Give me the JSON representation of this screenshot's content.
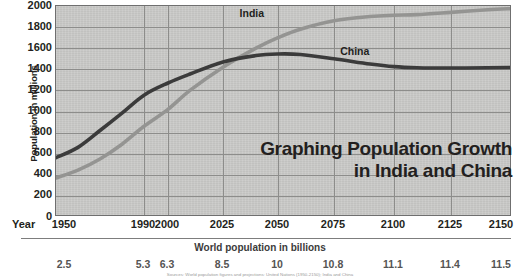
{
  "chart_data": {
    "type": "line",
    "title": "Graphing Population Growth in India and China",
    "title_line1": "Graphing Population Growth",
    "title_line2": "in India and China",
    "xlabel": "Year",
    "ylabel": "Population in millions",
    "secondary_xlabel": "World population in billions",
    "grid": true,
    "legend_position": "inline-labels",
    "xlim": [
      1950,
      2150
    ],
    "ylim": [
      0,
      2000
    ],
    "x_ticks": [
      1950,
      1990,
      2000,
      2025,
      2050,
      2075,
      2100,
      2125,
      2150
    ],
    "x_tick_labels": [
      "1950",
      "1990",
      "2000",
      "2025",
      "2050",
      "2075",
      "2100",
      "2125",
      "2150"
    ],
    "y_ticks": [
      0,
      200,
      400,
      600,
      800,
      1000,
      1200,
      1400,
      1600,
      1800,
      2000
    ],
    "y_tick_labels": [
      "0",
      "200",
      "400",
      "600",
      "800",
      "1000",
      "1200",
      "1400",
      "1600",
      "1800",
      "2000"
    ],
    "secondary_x_ticks": [
      1950,
      1990,
      2000,
      2025,
      2050,
      2075,
      2100,
      2125,
      2150
    ],
    "secondary_x_tick_labels": [
      "2.5",
      "5.3",
      "6.3",
      "8.5",
      "10",
      "10.8",
      "11.1",
      "11.4",
      "11.5"
    ],
    "series": [
      {
        "name": "China",
        "color": "#3b3b3b",
        "label_x": 2078,
        "label_y": 1560,
        "x": [
          1950,
          1960,
          1970,
          1980,
          1990,
          2000,
          2010,
          2025,
          2040,
          2050,
          2060,
          2075,
          2090,
          2100,
          2110,
          2125,
          2140,
          2150
        ],
        "values": [
          562,
          660,
          820,
          985,
          1155,
          1270,
          1355,
          1470,
          1530,
          1545,
          1540,
          1500,
          1450,
          1425,
          1415,
          1412,
          1415,
          1418
        ]
      },
      {
        "name": "India",
        "color": "#949492",
        "label_x": 2033,
        "label_y": 1925,
        "x": [
          1950,
          1960,
          1970,
          1980,
          1990,
          2000,
          2010,
          2025,
          2040,
          2050,
          2060,
          2075,
          2090,
          2100,
          2110,
          2125,
          2140,
          2150
        ],
        "values": [
          370,
          445,
          550,
          690,
          860,
          1020,
          1200,
          1420,
          1600,
          1700,
          1780,
          1860,
          1900,
          1912,
          1918,
          1940,
          1965,
          1975
        ]
      }
    ]
  },
  "series_labels": {
    "india": "India",
    "china": "China"
  },
  "footnote": "Sources: World population figures and projections: United Nations (1950-2150); India and China"
}
